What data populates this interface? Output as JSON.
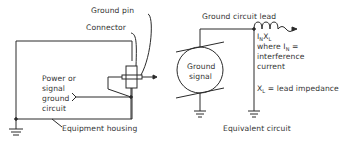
{
  "left_diagram": {
    "labels": {
      "ground_pin": "Ground pin",
      "connector": "Connector",
      "power_line1": "Power or",
      "power_line2": "signal",
      "power_line3": "ground",
      "power_line4": "circuit",
      "equipment_housing": "Equipment housing"
    }
  },
  "right_diagram": {
    "labels": {
      "ground_circuit_lead": "Ground circuit lead",
      "ground_signal_line1": "Ground",
      "ground_signal_line2": "signal",
      "inxl_I": "I",
      "inxl_N": "N",
      "inxl_X": "X",
      "inxl_L": "L",
      "where_text": "where I",
      "where_sub": "N",
      "where_eq": " =",
      "interference": "interference",
      "current": "current",
      "xl_X": "X",
      "xl_L": "L",
      "xl_rest": " = lead impedance",
      "caption": "Equivalent circuit"
    }
  },
  "colors": {
    "line": "#2a2a2a",
    "background": "#ffffff"
  }
}
